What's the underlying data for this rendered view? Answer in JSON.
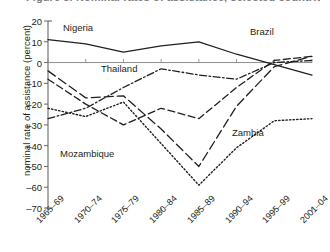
{
  "title": "Figure 5. Nominal rates of assistance, selected countries",
  "chart_data": {
    "type": "line",
    "title": "Figure 5. Nominal rates of assistance, selected countries",
    "xlabel": "",
    "ylabel": "nominal rate of assistance (percent)",
    "ylim": [
      -70,
      20
    ],
    "ytick_step": 10,
    "grid": false,
    "legend_position": "inline-labels",
    "zero_line": true,
    "categories": [
      "1965–69",
      "1970–74",
      "1975–79",
      "1980–84",
      "1985–89",
      "1990–94",
      "1995–99",
      "2001–04"
    ],
    "ytick_labels": [
      "20",
      "10",
      "0",
      "–10",
      "–20",
      "–30",
      "–40",
      "–50",
      "–60",
      "–70"
    ],
    "ytick_values": [
      20,
      10,
      0,
      -10,
      -20,
      -30,
      -40,
      -50,
      -60,
      -70
    ],
    "series": [
      {
        "name": "Nigeria",
        "style": "solid",
        "values": [
          11,
          9,
          5,
          8,
          10,
          4,
          -1,
          -6
        ],
        "label_x": 1965,
        "label_y": 16
      },
      {
        "name": "Brazil",
        "style": "dashed",
        "values": [
          -8,
          -20,
          -30,
          -22,
          -27,
          -12,
          1,
          3
        ],
        "label_x": 1999,
        "label_y": 13
      },
      {
        "name": "Thailand",
        "style": "dash-dot",
        "values": [
          -27,
          -22,
          -12,
          -3,
          -6,
          -8,
          0,
          1
        ],
        "label_x": 1977,
        "label_y": -2
      },
      {
        "name": "Mozambique",
        "style": "long-dash",
        "values": [
          -4,
          -17,
          -16,
          -32,
          -50,
          -21,
          -2,
          3
        ],
        "label_x": 1974,
        "label_y": -41
      },
      {
        "name": "Zambia",
        "style": "dotted",
        "values": [
          -22,
          -26,
          -19,
          -39,
          -59,
          -41,
          -28,
          -27
        ],
        "label_x": 1996,
        "label_y": -24
      }
    ]
  }
}
